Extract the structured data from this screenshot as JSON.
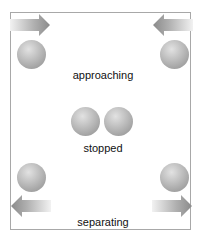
{
  "diagram": {
    "title": "",
    "states": [
      {
        "label": "approaching",
        "arrows": [
          "arrow-right",
          "arrow-left"
        ],
        "description": "two balls at the sides with arrows pointing inward"
      },
      {
        "label": "stopped",
        "arrows": [],
        "description": "two balls touching in the center"
      },
      {
        "label": "separating",
        "arrows": [
          "arrow-left",
          "arrow-right"
        ],
        "description": "two balls at the sides with arrows pointing outward"
      }
    ],
    "labels": {
      "approaching": "approaching",
      "stopped": "stopped",
      "separating": "separating"
    },
    "colors": {
      "frame_border": "#a8a8a8",
      "ball_light": "#e2e2e2",
      "ball_dark": "#8e8e8e",
      "arrow_light": "#f0f0f0",
      "arrow_dark": "#8a8a8a",
      "text": "#111111"
    }
  }
}
